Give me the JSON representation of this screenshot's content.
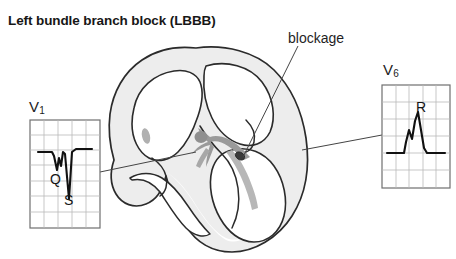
{
  "figure": {
    "title": "Left bundle branch block (LBBB)",
    "type": "anatomical-diagram",
    "background_color": "#ffffff"
  },
  "annotations": {
    "blockage": {
      "label": "blockage",
      "pointer": "line from label down-left to dark mark on left bundle branch"
    }
  },
  "heart": {
    "wall_fill": "#ededed",
    "wall_stroke": "#2b2b2b",
    "chamber_fill": "#ffffff",
    "conduction_fill": "#9a9a9a",
    "av_node_fill": "#8f8f8f",
    "blockage_mark_fill": "#3a3a3a",
    "papillary_fill": "#b0b0b0",
    "parts": [
      "right atrium",
      "left atrium",
      "right ventricle",
      "left ventricle",
      "interventricular septum",
      "av-node",
      "bundle of his",
      "left bundle branch",
      "right bundle branch"
    ]
  },
  "ecg": {
    "grid_color": "#b9b9b9",
    "border_color": "#6f6f6f",
    "trace_color": "#111111",
    "leads": [
      {
        "name": "V1",
        "label_text": "V",
        "label_sub": "1",
        "box": {
          "x": 30,
          "y": 120,
          "width": 70,
          "height": 108
        },
        "grid": {
          "cols": 5,
          "rows": 7
        },
        "morphology": "rS / QS complex — deep negative deflection, broad",
        "wave_letters": [
          {
            "text": "Q",
            "meaning": "Q wave"
          },
          {
            "text": "S",
            "meaning": "S wave"
          }
        ],
        "connector": "line from box right edge to heart apex / right ventricle"
      },
      {
        "name": "V6",
        "label_text": "V",
        "label_sub": "6",
        "box": {
          "x": 382,
          "y": 85,
          "width": 68,
          "height": 103
        },
        "grid": {
          "cols": 5,
          "rows": 6
        },
        "morphology": "broad notched R wave (RsR' / M-shaped)",
        "wave_letters": [
          {
            "text": "R",
            "meaning": "R wave"
          }
        ],
        "connector": "line from box left edge to heart left ventricular free wall"
      }
    ]
  }
}
